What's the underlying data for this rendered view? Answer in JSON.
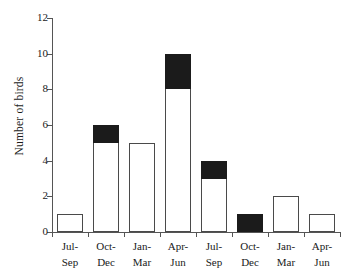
{
  "chart_data": {
    "type": "bar",
    "title": "",
    "xlabel": "",
    "ylabel": "Number of birds",
    "ylim": [
      0,
      12
    ],
    "ytick_values": [
      0,
      2,
      4,
      6,
      8,
      10,
      12
    ],
    "ytick_labels": [
      "0",
      "2",
      "4",
      "6",
      "8",
      "10",
      "12"
    ],
    "grid": false,
    "legend": null,
    "categories": [
      "Jul-Sep",
      "Oct-Dec",
      "Jan-Mar",
      "Apr-Jun",
      "Jul-Sep",
      "Oct-Dec",
      "Jan-Mar",
      "Apr-Jun"
    ],
    "category_lines": [
      [
        "Jul-",
        "Sep"
      ],
      [
        "Oct-",
        "Dec"
      ],
      [
        "Jan-",
        "Mar"
      ],
      [
        "Apr-",
        "Jun"
      ],
      [
        "Jul-",
        "Sep"
      ],
      [
        "Oct-",
        "Dec"
      ],
      [
        "Jan-",
        "Mar"
      ],
      [
        "Apr-",
        "Jun"
      ]
    ],
    "values": [
      1,
      6,
      5,
      10,
      4,
      1,
      2,
      1
    ],
    "series": [
      {
        "name": "open",
        "fill": "#ffffff",
        "values": [
          1,
          5,
          5,
          8,
          3,
          0,
          2,
          1
        ]
      },
      {
        "name": "filled",
        "fill": "#1b1b1b",
        "values": [
          0,
          1,
          0,
          2,
          1,
          1,
          0,
          0
        ]
      }
    ],
    "bar_edge_color": "#4a4a4a",
    "axis_color": "#555555",
    "background": "#ffffff"
  }
}
